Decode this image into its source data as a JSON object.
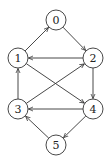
{
  "diagram": {
    "type": "directed-graph",
    "nodes": [
      {
        "id": "0",
        "label": "0",
        "x": 56,
        "y": 20
      },
      {
        "id": "1",
        "label": "1",
        "x": 18,
        "y": 58
      },
      {
        "id": "2",
        "label": "2",
        "x": 93,
        "y": 58
      },
      {
        "id": "3",
        "label": "3",
        "x": 18,
        "y": 109
      },
      {
        "id": "4",
        "label": "4",
        "x": 93,
        "y": 109
      },
      {
        "id": "5",
        "label": "5",
        "x": 56,
        "y": 145
      }
    ],
    "edges": [
      {
        "from": "1",
        "to": "0"
      },
      {
        "from": "0",
        "to": "2"
      },
      {
        "from": "2",
        "to": "1"
      },
      {
        "from": "3",
        "to": "1"
      },
      {
        "from": "1",
        "to": "4"
      },
      {
        "from": "3",
        "to": "2"
      },
      {
        "from": "2",
        "to": "4"
      },
      {
        "from": "4",
        "to": "3"
      },
      {
        "from": "4",
        "to": "5"
      },
      {
        "from": "5",
        "to": "3"
      }
    ],
    "node_radius": 10,
    "stroke_color": "#333333",
    "fill_color": "#ffffff"
  }
}
